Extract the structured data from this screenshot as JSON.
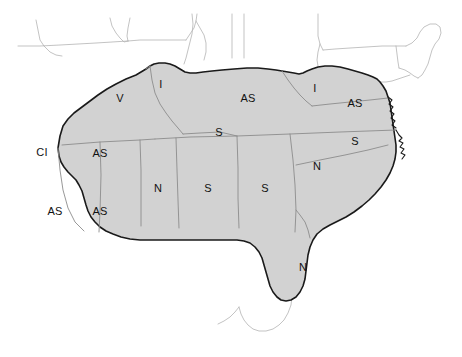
{
  "figure": {
    "kind": "thematic-map",
    "region": "Southeastern United States",
    "width": 462,
    "height": 357
  },
  "colors": {
    "page_background": "#ffffff",
    "shaded_region_fill": "#d2d2d2",
    "shaded_region_outline": "#1a1a1a",
    "internal_state_border": "#8c8c8c",
    "unshaded_state_outline": "#b4b4b4",
    "label_text": "#111111",
    "coastline": "#1a1a1a"
  },
  "map": {
    "shaded_label": "shaded study area",
    "unshaded_label": "unshaded area"
  },
  "labels": [
    {
      "id": "oklahoma",
      "code": "CI",
      "x": 42,
      "y": 152,
      "shaded": true
    },
    {
      "id": "missouri",
      "code": "V",
      "x": 120,
      "y": 98,
      "shaded": true
    },
    {
      "id": "illinois",
      "code": "I",
      "x": 161,
      "y": 84,
      "shaded": true
    },
    {
      "id": "kentucky",
      "code": "AS",
      "x": 248,
      "y": 98,
      "shaded": true
    },
    {
      "id": "west-virginia",
      "code": "I",
      "x": 315,
      "y": 88,
      "shaded": true
    },
    {
      "id": "virginia",
      "code": "AS",
      "x": 355,
      "y": 103,
      "shaded": true
    },
    {
      "id": "arkansas",
      "code": "AS",
      "x": 100,
      "y": 153,
      "shaded": true
    },
    {
      "id": "tennessee",
      "code": "S",
      "x": 219,
      "y": 132,
      "shaded": true
    },
    {
      "id": "north-carolina",
      "code": "S",
      "x": 355,
      "y": 141,
      "shaded": true
    },
    {
      "id": "texas",
      "code": "AS",
      "x": 55,
      "y": 211,
      "shaded": true
    },
    {
      "id": "louisiana",
      "code": "AS",
      "x": 100,
      "y": 211,
      "shaded": true
    },
    {
      "id": "mississippi",
      "code": "N",
      "x": 158,
      "y": 188,
      "shaded": true
    },
    {
      "id": "alabama",
      "code": "S",
      "x": 208,
      "y": 188,
      "shaded": true
    },
    {
      "id": "georgia",
      "code": "S",
      "x": 265,
      "y": 188,
      "shaded": true
    },
    {
      "id": "south-carolina",
      "code": "N",
      "x": 317,
      "y": 166,
      "shaded": true
    },
    {
      "id": "florida",
      "code": "N",
      "x": 303,
      "y": 267,
      "shaded": true
    }
  ],
  "geometry": {
    "shaded_region_path": "M 58 148 L 60 136 L 63 126 L 68 119 L 74 113 L 82 107 L 90 101 L 98 95 L 107 89 L 116 84 L 126 79 L 136 75 L 141 72 L 146 69 L 150 66 L 154 64 L 159 63 L 165 63 L 170 64 L 175 66 L 180 69 L 185 72 L 190 73 L 196 73 L 203 72 L 212 71 L 222 70 L 234 69 L 247 68 L 258 68 L 268 69 L 276 70 L 282 71 L 288 72 L 294 73 L 299 74 L 303 73 L 307 71 L 312 69 L 318 67 L 325 66 L 332 66 L 340 67 L 348 69 L 355 71 L 362 73 L 368 75 L 373 77 L 377 79 L 380 82 L 383 86 L 386 91 L 388 97 L 390 103 L 391 110 L 392 117 L 393 124 L 394 131 L 395 138 L 396 145 L 396 152 L 395 159 L 393 166 L 390 173 L 386 180 L 381 187 L 375 194 L 369 200 L 362 206 L 354 212 L 346 217 L 338 221 L 330 225 L 323 229 L 317 234 L 313 240 L 310 247 L 308 255 L 307 263 L 306 271 L 305 279 L 303 286 L 300 292 L 296 297 L 291 300 L 286 301 L 281 300 L 277 297 L 273 292 L 270 286 L 268 279 L 266 272 L 264 265 L 262 258 L 259 252 L 255 247 L 250 243 L 244 241 L 237 240 L 229 240 L 220 240 L 210 240 L 199 240 L 187 240 L 175 240 L 163 240 L 151 240 L 140 240 L 130 239 L 121 237 L 113 234 L 106 231 L 100 227 L 95 222 L 91 217 L 88 211 L 86 205 L 84 198 L 82 191 L 79 185 L 76 180 L 72 176 L 68 172 L 64 167 L 61 162 L 59 156 Z",
    "internal_borders": [
      "M 62 145 L 100 142 L 140 140 L 155 139",
      "M 100 142 L 101 175 L 100 212 L 99 232",
      "M 58 148 L 60 170 L 63 190 L 68 208 L 75 222 L 84 231",
      "M 140 140 L 141 170 L 141 200 L 141 226",
      "M 176 138 L 177 170 L 178 200 L 179 228",
      "M 237 136 L 238 168 L 238 198 L 239 228",
      "M 155 139 L 190 137 L 237 136 L 290 134 L 340 132 L 396 130",
      "M 290 134 L 293 160 L 295 185 L 296 210 L 295 232",
      "M 296 165 L 320 160 L 345 155 L 368 150 L 388 145",
      "M 150 66 L 152 80 L 155 93 L 160 104 L 166 113 L 172 121 L 178 128 L 183 134",
      "M 183 134 L 200 133 L 220 132 L 237 136",
      "M 282 71 L 288 80 L 294 88 L 300 95 L 306 101 L 312 106",
      "M 312 106 L 330 104 L 350 102 L 370 100 L 388 98",
      "M 146 69 L 150 66",
      "M 296 210 L 300 215 L 305 222 L 308 230 L 310 238"
    ],
    "unshaded_outlines": [
      "M 18 46 L 40 46 L 60 45 L 78 44 L 96 43 L 112 42 L 128 41",
      "M 36 20 L 38 30 L 40 40 L 44 46",
      "M 44 46 L 50 52 L 56 55 L 62 56",
      "M 110 18 L 112 26 L 116 33 L 120 38 L 124 42 L 128 41",
      "M 128 41 L 140 40 L 152 40 L 164 40 L 176 40 L 186 40",
      "M 186 40 L 190 34 L 194 28 L 196 21 L 197 14",
      "M 130 18 L 128 28 L 127 36 L 128 41",
      "M 192 14 L 193 24 L 192 34 L 190 42 L 188 50 L 186 58 L 184 64",
      "M 196 21 L 200 28 L 204 35 L 206 43 L 206 52 L 204 60",
      "M 232 14 L 232 30 L 232 46 L 232 58",
      "M 244 14 L 244 30 L 244 46 L 244 58",
      "M 318 14 L 318 26 L 318 36 L 320 44 L 323 50",
      "M 323 50 L 335 49 L 350 48 L 366 47 L 382 46 L 396 46 L 406 46",
      "M 406 46 L 412 43 L 417 38 L 420 32 L 424 27 L 430 24 L 436 24 L 440 27 L 441 33 L 439 39 L 435 44 L 432 50 L 430 57 L 428 64 L 425 70 L 422 75 L 418 78",
      "M 320 44 L 318 52 L 317 60 L 318 66",
      "M 396 46 L 397 54 L 398 62 L 399 68",
      "M 399 68 L 405 70 L 410 73 L 414 76 L 418 78",
      "M 380 82 L 386 82 L 392 81 L 398 79 L 404 77 L 410 75",
      "M 282 257 L 286 266 L 289 276 L 291 286 L 292 296 L 291 305 L 288 313 L 284 320 L 279 325 L 273 329 L 266 331 L 259 331 L 253 329 L 248 325 L 244 320 L 241 314 L 239 307",
      "M 239 307 L 235 312 L 230 317 L 224 321 L 218 324"
    ],
    "coastline_detail": [
      "M 396 130 L 399 135 L 402 138 L 399 141 L 403 143 L 400 147 L 404 149 L 401 153 L 405 155 L 402 159",
      "M 388 97 L 392 100 L 389 104 L 393 107 L 390 111 L 394 114 L 391 118 L 395 121 L 392 125 L 396 128"
    ]
  }
}
